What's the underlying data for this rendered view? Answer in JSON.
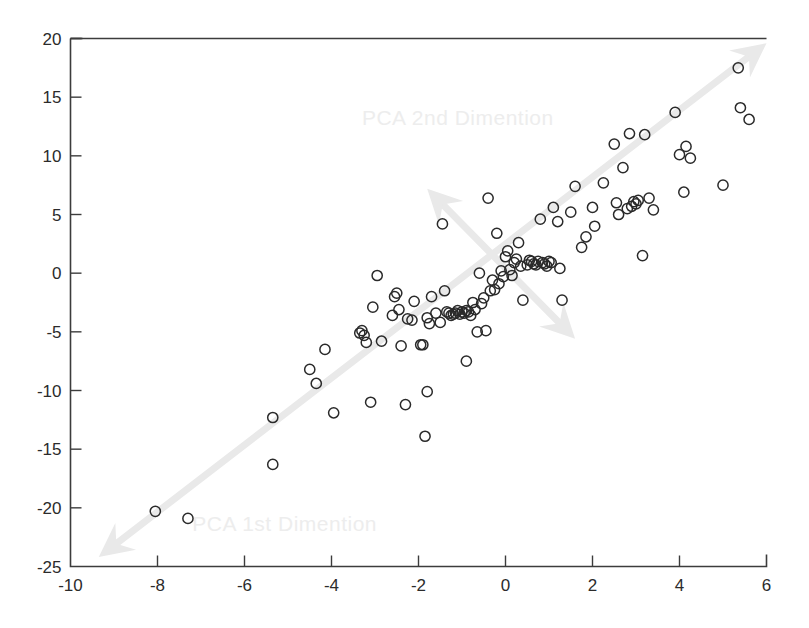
{
  "chart_data": {
    "type": "scatter",
    "title": "",
    "xlabel": "",
    "ylabel": "",
    "xlim": [
      -10,
      6
    ],
    "ylim": [
      -25,
      20
    ],
    "grid": false,
    "legend": null,
    "xticks": [
      -10,
      -8,
      -6,
      -4,
      -2,
      0,
      2,
      4,
      6
    ],
    "xticklabels": [
      "-10",
      "-8",
      "-6",
      "-4",
      "-2",
      "0",
      "2",
      "4",
      "6"
    ],
    "yticks": [
      -25,
      -20,
      -15,
      -10,
      -5,
      0,
      5,
      10,
      15,
      20
    ],
    "yticklabels": [
      "-25",
      "-20",
      "-15",
      "-10",
      "-5",
      "0",
      "5",
      "10",
      "15",
      "20"
    ],
    "marker": "open-circle",
    "marker_color": "#2a2a2a",
    "annotation_color": "#e9e9e9",
    "annotations": [
      {
        "name": "pca-1st-dimension",
        "label": "PCA 1st Dimention",
        "label_x": -7.2,
        "label_y": -22.0,
        "type": "double-arrow",
        "from_x": -9.35,
        "from_y": -24.2,
        "to_x": 6.0,
        "to_y": 19.6
      },
      {
        "name": "pca-2nd-dimension",
        "label": "PCA 2nd Dimention",
        "label_x": -3.3,
        "label_y": 12.6,
        "type": "double-arrow",
        "from_x": -1.8,
        "from_y": 7.2,
        "to_x": 1.6,
        "to_y": -5.6
      }
    ],
    "points": [
      [
        -8.05,
        -20.3
      ],
      [
        -7.3,
        -20.9
      ],
      [
        -5.35,
        -16.3
      ],
      [
        -5.35,
        -12.3
      ],
      [
        -4.5,
        -8.2
      ],
      [
        -4.35,
        -9.4
      ],
      [
        -4.15,
        -6.5
      ],
      [
        -3.95,
        -11.9
      ],
      [
        -3.35,
        -5.1
      ],
      [
        -3.3,
        -4.9
      ],
      [
        -3.25,
        -5.3
      ],
      [
        -3.2,
        -5.9
      ],
      [
        -3.1,
        -11.0
      ],
      [
        -3.05,
        -2.9
      ],
      [
        -2.95,
        -0.2
      ],
      [
        -2.85,
        -5.8
      ],
      [
        -2.6,
        -3.6
      ],
      [
        -2.55,
        -2.0
      ],
      [
        -2.5,
        -1.7
      ],
      [
        -2.45,
        -3.1
      ],
      [
        -2.4,
        -6.2
      ],
      [
        -2.3,
        -11.2
      ],
      [
        -2.25,
        -3.9
      ],
      [
        -2.15,
        -4.0
      ],
      [
        -2.1,
        -2.4
      ],
      [
        -1.95,
        -6.1
      ],
      [
        -1.9,
        -6.1
      ],
      [
        -1.85,
        -13.9
      ],
      [
        -1.8,
        -3.8
      ],
      [
        -1.8,
        -10.1
      ],
      [
        -1.75,
        -4.3
      ],
      [
        -1.7,
        -2.0
      ],
      [
        -1.6,
        -3.4
      ],
      [
        -1.5,
        -4.2
      ],
      [
        -1.45,
        4.2
      ],
      [
        -1.4,
        -1.5
      ],
      [
        -1.35,
        -3.3
      ],
      [
        -1.3,
        -3.4
      ],
      [
        -1.25,
        -3.6
      ],
      [
        -1.2,
        -3.5
      ],
      [
        -1.15,
        -3.4
      ],
      [
        -1.1,
        -3.2
      ],
      [
        -1.05,
        -3.5
      ],
      [
        -1.0,
        -3.3
      ],
      [
        -0.95,
        -3.4
      ],
      [
        -0.9,
        -3.2
      ],
      [
        -0.9,
        -7.5
      ],
      [
        -0.85,
        -3.3
      ],
      [
        -0.8,
        -3.6
      ],
      [
        -0.75,
        -2.5
      ],
      [
        -0.7,
        -3.1
      ],
      [
        -0.65,
        -5.0
      ],
      [
        -0.6,
        0.0
      ],
      [
        -0.55,
        -2.6
      ],
      [
        -0.5,
        -2.1
      ],
      [
        -0.45,
        -4.9
      ],
      [
        -0.4,
        6.4
      ],
      [
        -0.35,
        -1.5
      ],
      [
        -0.3,
        -0.6
      ],
      [
        -0.25,
        -1.4
      ],
      [
        -0.2,
        3.4
      ],
      [
        -0.15,
        -0.9
      ],
      [
        -0.1,
        0.2
      ],
      [
        -0.05,
        -0.3
      ],
      [
        0.0,
        1.4
      ],
      [
        0.05,
        1.9
      ],
      [
        0.1,
        0.3
      ],
      [
        0.15,
        -0.2
      ],
      [
        0.2,
        0.9
      ],
      [
        0.25,
        1.2
      ],
      [
        0.3,
        2.6
      ],
      [
        0.35,
        0.6
      ],
      [
        0.4,
        -2.3
      ],
      [
        0.5,
        0.7
      ],
      [
        0.55,
        1.1
      ],
      [
        0.6,
        1.0
      ],
      [
        0.65,
        0.8
      ],
      [
        0.7,
        0.7
      ],
      [
        0.75,
        1.0
      ],
      [
        0.8,
        4.6
      ],
      [
        0.85,
        0.9
      ],
      [
        0.9,
        0.8
      ],
      [
        0.95,
        0.6
      ],
      [
        1.0,
        1.0
      ],
      [
        1.05,
        0.9
      ],
      [
        1.1,
        5.6
      ],
      [
        1.2,
        4.4
      ],
      [
        1.25,
        0.4
      ],
      [
        1.3,
        -2.3
      ],
      [
        1.5,
        5.2
      ],
      [
        1.6,
        7.4
      ],
      [
        1.75,
        2.2
      ],
      [
        1.85,
        3.1
      ],
      [
        2.0,
        5.6
      ],
      [
        2.05,
        4.0
      ],
      [
        2.25,
        7.7
      ],
      [
        2.5,
        11.0
      ],
      [
        2.55,
        6.0
      ],
      [
        2.6,
        5.0
      ],
      [
        2.7,
        9.0
      ],
      [
        2.8,
        5.5
      ],
      [
        2.85,
        11.9
      ],
      [
        2.9,
        5.7
      ],
      [
        2.95,
        6.1
      ],
      [
        3.0,
        5.9
      ],
      [
        3.05,
        6.2
      ],
      [
        3.15,
        1.5
      ],
      [
        3.2,
        11.8
      ],
      [
        3.3,
        6.4
      ],
      [
        3.4,
        5.4
      ],
      [
        3.9,
        13.7
      ],
      [
        4.0,
        10.1
      ],
      [
        4.1,
        6.9
      ],
      [
        4.15,
        10.8
      ],
      [
        4.25,
        9.8
      ],
      [
        5.0,
        7.5
      ],
      [
        5.35,
        17.5
      ],
      [
        5.4,
        14.1
      ],
      [
        5.6,
        13.1
      ]
    ]
  },
  "figure": {
    "name": "pca-scatter-plot"
  }
}
